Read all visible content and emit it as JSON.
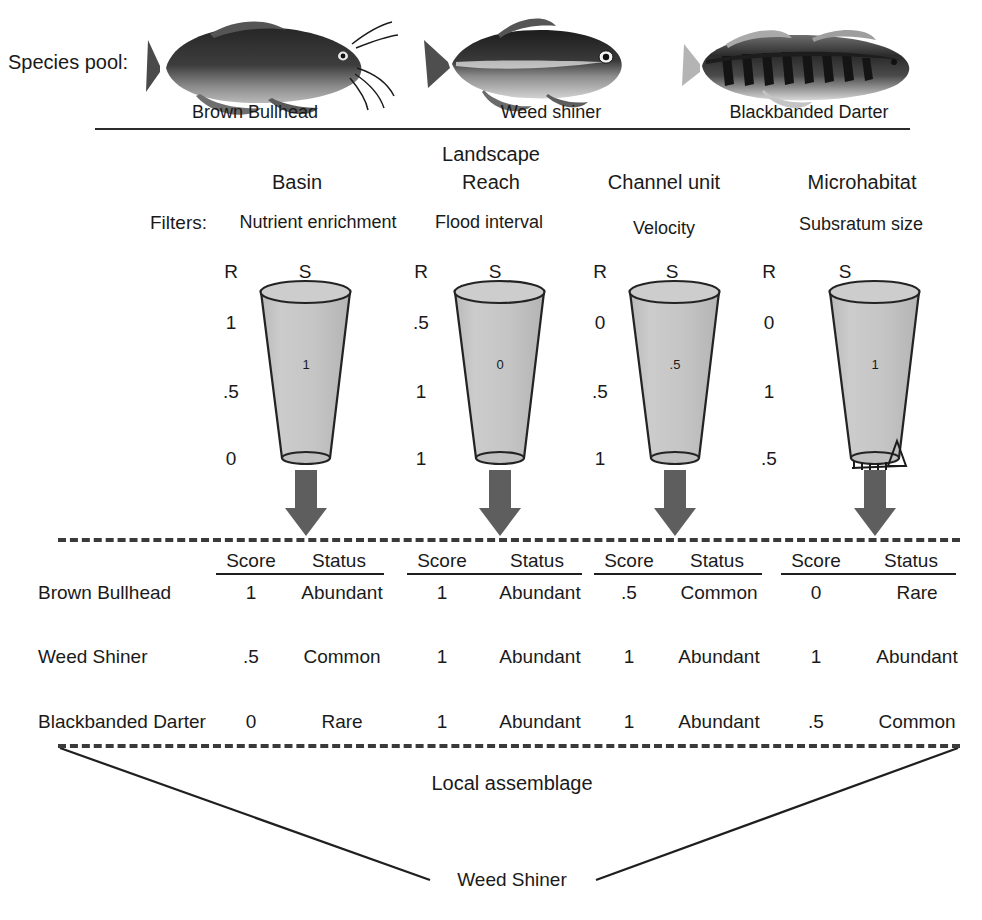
{
  "diagram": {
    "species_pool_label": "Species pool:",
    "landscape_title": "Landscape",
    "filters_label": "Filters:",
    "local_assemblage_label": "Local assemblage",
    "outcome_label": "Weed Shiner",
    "score_header": "Score",
    "status_header": "Status",
    "scale_r_label": "R",
    "scale_s_label": "S"
  },
  "species_pool": [
    {
      "name": "Brown Bullhead",
      "icon": "catfish-icon"
    },
    {
      "name": "Weed shiner",
      "icon": "minnow-icon"
    },
    {
      "name": "Blackbanded Darter",
      "icon": "darter-icon"
    }
  ],
  "levels": [
    {
      "tier": "Basin",
      "filter": "Nutrient enrichment",
      "scale_values": [
        "1",
        ".5",
        "0"
      ],
      "funnel_value": "1",
      "has_sieve": false
    },
    {
      "tier": "Reach",
      "filter": "Flood interval",
      "scale_values": [
        ".5",
        "1",
        "1"
      ],
      "funnel_value": "0",
      "has_sieve": false
    },
    {
      "tier": "Channel unit",
      "filter": "Velocity",
      "scale_values": [
        "0",
        ".5",
        "1"
      ],
      "funnel_value": ".5",
      "has_sieve": false
    },
    {
      "tier": "Microhabitat",
      "filter": "Subsratum size",
      "scale_values": [
        "0",
        "1",
        ".5"
      ],
      "funnel_value": "1",
      "has_sieve": true
    }
  ],
  "assemblage_table": {
    "row_labels": [
      "Brown Bullhead",
      "Weed Shiner",
      "Blackbanded Darter"
    ],
    "rows": [
      {
        "species": "Brown Bullhead",
        "cells": [
          {
            "score": "1",
            "status": "Abundant"
          },
          {
            "score": "1",
            "status": "Abundant"
          },
          {
            "score": ".5",
            "status": "Common"
          },
          {
            "score": "0",
            "status": "Rare"
          }
        ]
      },
      {
        "species": "Weed Shiner",
        "cells": [
          {
            "score": ".5",
            "status": "Common"
          },
          {
            "score": "1",
            "status": "Abundant"
          },
          {
            "score": "1",
            "status": "Abundant"
          },
          {
            "score": "1",
            "status": "Abundant"
          }
        ]
      },
      {
        "species": "Blackbanded Darter",
        "cells": [
          {
            "score": "0",
            "status": "Rare"
          },
          {
            "score": "1",
            "status": "Abundant"
          },
          {
            "score": "1",
            "status": "Abundant"
          },
          {
            "score": ".5",
            "status": "Common"
          }
        ]
      }
    ]
  },
  "colors": {
    "ink": "#1a1a1a",
    "funnel_fill": "#c6c6c6",
    "funnel_stroke": "#232323",
    "arrow_fill": "#5e5e5e",
    "rule": "#2b2b2b",
    "dash": "#3a3a3a"
  }
}
